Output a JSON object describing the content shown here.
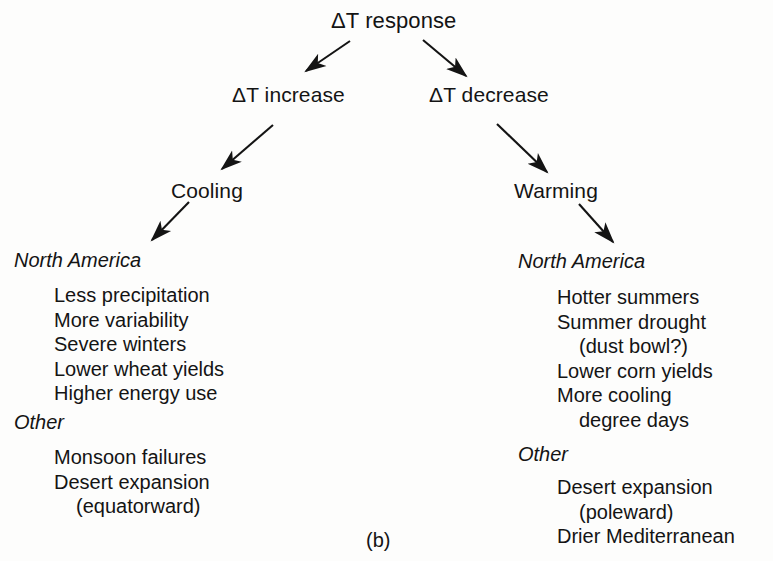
{
  "figure": {
    "caption": "(b)",
    "background_color": "#fdfdfc",
    "text_color": "#141414"
  },
  "tree": {
    "root": {
      "label": "ΔT response"
    },
    "level2": [
      {
        "label": "ΔT increase"
      },
      {
        "label": "ΔT decrease"
      }
    ],
    "level3": [
      {
        "label": "Cooling"
      },
      {
        "label": "Warming"
      }
    ]
  },
  "branches": {
    "cooling": {
      "groups": [
        {
          "heading": "North America",
          "items": [
            {
              "text": "Less precipitation",
              "continuation": false
            },
            {
              "text": "More variability",
              "continuation": false
            },
            {
              "text": "Severe winters",
              "continuation": false
            },
            {
              "text": "Lower wheat yields",
              "continuation": false
            },
            {
              "text": "Higher energy use",
              "continuation": false
            }
          ]
        },
        {
          "heading": "Other",
          "items": [
            {
              "text": "Monsoon failures",
              "continuation": false
            },
            {
              "text": "Desert expansion",
              "continuation": false
            },
            {
              "text": "(equatorward)",
              "continuation": true
            }
          ]
        }
      ]
    },
    "warming": {
      "groups": [
        {
          "heading": "North America",
          "items": [
            {
              "text": "Hotter summers",
              "continuation": false
            },
            {
              "text": "Summer drought",
              "continuation": false
            },
            {
              "text": "(dust bowl?)",
              "continuation": true
            },
            {
              "text": "Lower corn yields",
              "continuation": false
            },
            {
              "text": "More cooling",
              "continuation": false
            },
            {
              "text": "degree days",
              "continuation": true
            }
          ]
        },
        {
          "heading": "Other",
          "items": [
            {
              "text": "Desert expansion",
              "continuation": false
            },
            {
              "text": "(poleward)",
              "continuation": true
            },
            {
              "text": "Drier Mediterranean",
              "continuation": false
            }
          ]
        }
      ]
    }
  },
  "arrows": [
    {
      "name": "root-to-increase",
      "from_x": 350,
      "from_y": 41,
      "to_x": 302,
      "to_y": 74
    },
    {
      "name": "root-to-decrease",
      "from_x": 423,
      "from_y": 40,
      "to_x": 470,
      "to_y": 79
    },
    {
      "name": "increase-to-cooling",
      "from_x": 273,
      "from_y": 125,
      "to_x": 217,
      "to_y": 173
    },
    {
      "name": "decrease-to-warming",
      "from_x": 497,
      "from_y": 124,
      "to_x": 552,
      "to_y": 176
    },
    {
      "name": "cooling-to-north-america-left",
      "from_x": 189,
      "from_y": 202,
      "to_x": 147,
      "to_y": 244
    },
    {
      "name": "warming-to-north-america-right",
      "from_x": 579,
      "from_y": 204,
      "to_x": 617,
      "to_y": 246
    }
  ]
}
